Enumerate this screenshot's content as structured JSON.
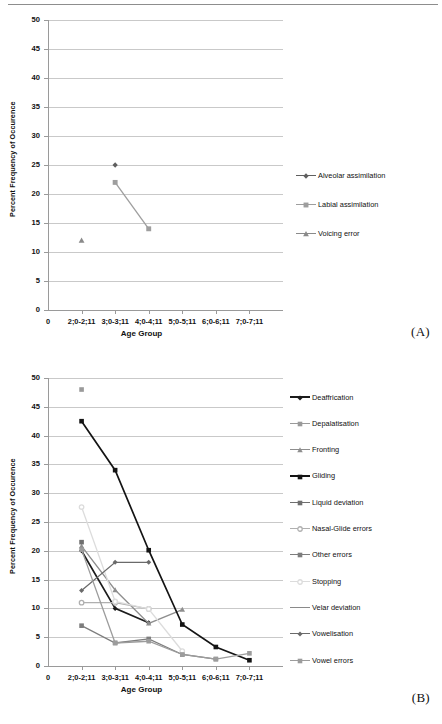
{
  "figure": {
    "panel_a_label": "(A)",
    "panel_b_label": "(B)"
  },
  "axes": {
    "ylabel": "Percent Frequency of Occurence",
    "xlabel": "Age Group",
    "yticks": [
      "0",
      "5",
      "10",
      "15",
      "20",
      "25",
      "30",
      "35",
      "40",
      "45",
      "50"
    ],
    "xticks": [
      "0",
      "2;0-2;11",
      "3;0-3;11",
      "4;0-4;11",
      "5;0-5;11",
      "6;0-6;11",
      "7;0-7;11"
    ]
  },
  "chart_data": [
    {
      "id": "A",
      "type": "line",
      "title": "",
      "xlabel": "Age Group",
      "ylabel": "Percent Frequency of Occurence",
      "ylim": [
        0,
        50
      ],
      "ytick_step": 5,
      "grid": true,
      "legend_position": "right",
      "categories": [
        "2;0-2;11",
        "3;0-3;11",
        "4;0-4;11",
        "5;0-5;11",
        "6;0-6;11",
        "7;0-7;11"
      ],
      "series": [
        {
          "name": "Alveolar assimilation",
          "marker": "diamond",
          "color": "#5f5f5f",
          "values": [
            null,
            25,
            null,
            null,
            null,
            null
          ]
        },
        {
          "name": "Labial assimilation",
          "marker": "square",
          "color": "#9e9e9e",
          "values": [
            null,
            22,
            14,
            null,
            null,
            null
          ]
        },
        {
          "name": "Voicing error",
          "marker": "triangle",
          "color": "#8a8a8a",
          "values": [
            12,
            null,
            null,
            null,
            null,
            null
          ]
        }
      ]
    },
    {
      "id": "B",
      "type": "line",
      "title": "",
      "xlabel": "Age Group",
      "ylabel": "Percent Frequency of Occurence",
      "ylim": [
        0,
        50
      ],
      "ytick_step": 5,
      "grid": true,
      "legend_position": "right",
      "categories": [
        "2;0-2;11",
        "3;0-3;11",
        "4;0-4;11",
        "5;0-5;11",
        "6;0-6;11",
        "7;0-7;11"
      ],
      "series": [
        {
          "name": "Deaffrication",
          "marker": "diamond",
          "color": "#1c1c1c",
          "values": [
            20.0,
            10.0,
            7.5,
            null,
            null,
            null
          ]
        },
        {
          "name": "Depalatisation",
          "marker": "square",
          "color": "#9a9a9a",
          "values": [
            48.0,
            null,
            null,
            null,
            null,
            null
          ]
        },
        {
          "name": "Fronting",
          "marker": "triangle",
          "color": "#8e8e8e",
          "values": [
            20.8,
            13.2,
            7.4,
            9.8,
            null,
            null
          ]
        },
        {
          "name": "Gliding",
          "marker": "square",
          "color": "#141414",
          "values": [
            42.5,
            34.0,
            20.1,
            7.2,
            3.3,
            1.0
          ]
        },
        {
          "name": "Liquid deviation",
          "marker": "square",
          "color": "#6f6f6f",
          "values": [
            21.5,
            null,
            null,
            null,
            null,
            null
          ]
        },
        {
          "name": "Nasal-Glide errors",
          "marker": "circle",
          "color": "#b0b0b0",
          "values": [
            11.0,
            11.0,
            9.9,
            null,
            null,
            null
          ]
        },
        {
          "name": "Other errors",
          "marker": "square",
          "color": "#7d7d7d",
          "values": [
            7.0,
            4.0,
            4.7,
            2.0,
            1.2,
            null
          ]
        },
        {
          "name": "Stopping",
          "marker": "circle",
          "color": "#dcdcdc",
          "values": [
            27.6,
            11.2,
            9.9,
            2.6,
            null,
            null
          ]
        },
        {
          "name": "Velar deviation",
          "marker": "none",
          "color": "#8a8a8a",
          "values": [
            21.0,
            null,
            null,
            null,
            null,
            null
          ]
        },
        {
          "name": "Vowelisation",
          "marker": "diamond",
          "color": "#6a6a6a",
          "values": [
            13.1,
            18.0,
            18.0,
            null,
            null,
            null
          ]
        },
        {
          "name": "Vowel errors",
          "marker": "square",
          "color": "#9c9c9c",
          "values": [
            20.2,
            4.0,
            4.3,
            2.0,
            1.2,
            2.2
          ]
        }
      ]
    }
  ]
}
